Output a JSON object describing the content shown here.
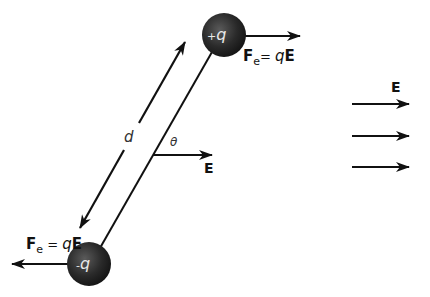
{
  "diagram": {
    "positive_charge": {
      "label_sign": "+",
      "label_q": "q"
    },
    "negative_charge": {
      "label_sign": "-",
      "label_q": "q"
    },
    "force_top": {
      "symbol": "F",
      "sub": "e",
      "eq": "= ",
      "q": "q",
      "E": "E"
    },
    "force_bottom": {
      "symbol": "F",
      "sub": "e",
      "eq": " = ",
      "q": "q",
      "E": "E"
    },
    "separation_label": "d",
    "angle_label": "θ",
    "angle_field_label": "E",
    "field_label": "E",
    "field_arrows_count": 3,
    "colors": {
      "line": "#111111",
      "sphere_dark": "#1c1c1c",
      "sphere_light": "#5a5a5a",
      "background": "#ffffff"
    }
  }
}
